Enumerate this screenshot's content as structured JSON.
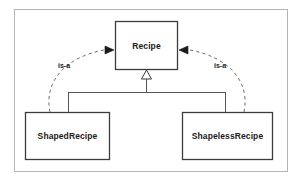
{
  "diagram": {
    "kind": "uml-class-diagram",
    "colors": {
      "background": "#ffffff",
      "frame_stroke": "#b4b4b4",
      "node_stroke": "#3c3c3c",
      "node_fill": "#ffffff",
      "edge_stroke": "#555555",
      "dashed_edge_stroke": "#6e6e6e",
      "text": "#1a1a1a"
    },
    "frame": {
      "x": 14,
      "y": 9,
      "width": 274,
      "height": 163
    },
    "nodes": [
      {
        "id": "recipe",
        "label": "Recipe",
        "x": 115,
        "y": 21,
        "width": 63,
        "height": 49,
        "role": "superclass"
      },
      {
        "id": "shaped-recipe",
        "label": "ShapedRecipe",
        "x": 25,
        "y": 112,
        "width": 85,
        "height": 48,
        "role": "subclass"
      },
      {
        "id": "shapeless-recipe",
        "label": "ShapelessRecipe",
        "x": 182,
        "y": 112,
        "width": 91,
        "height": 48,
        "role": "subclass"
      }
    ],
    "edges": [
      {
        "id": "generalization-shaped",
        "from": "shaped-recipe",
        "to": "recipe",
        "style": "solid",
        "arrow": "hollow-triangle",
        "label": ""
      },
      {
        "id": "generalization-shapeless",
        "from": "shapeless-recipe",
        "to": "recipe",
        "style": "solid",
        "arrow": "hollow-triangle",
        "label": ""
      },
      {
        "id": "is-a-left",
        "from": "shaped-recipe",
        "to": "recipe",
        "style": "dashed",
        "arrow": "filled-arrow",
        "label": "is-a",
        "label_x": 58,
        "label_y": 62
      },
      {
        "id": "is-a-right",
        "from": "shapeless-recipe",
        "to": "recipe",
        "style": "dashed",
        "arrow": "filled-arrow",
        "label": "is-a",
        "label_x": 214,
        "label_y": 62
      }
    ]
  }
}
